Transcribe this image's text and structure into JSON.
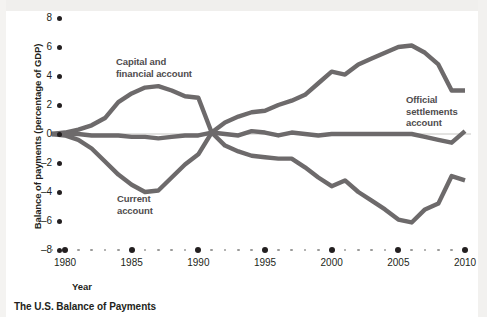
{
  "caption": "The U.S. Balance of Payments",
  "colors": {
    "line": "#6d6a6b",
    "text": "#231f20",
    "annotation": "#4f4c4d",
    "zero_rule": "#b9b7b4",
    "tick_minor": "#9a9a99",
    "background": "#ffffff"
  },
  "axes": {
    "y_title": "Balance of payments (percentage of GDP)",
    "x_title": "Year",
    "y_ticks": [
      "8",
      "6",
      "4",
      "2",
      "0",
      "–2",
      "–4",
      "–6",
      "–8"
    ],
    "x_ticks": [
      "1980",
      "1985",
      "1990",
      "1995",
      "2000",
      "2005",
      "2010"
    ]
  },
  "annotations": {
    "capital": "Capital and\nfinancial account",
    "capital_line1": "Capital and",
    "capital_line2": "financial account",
    "current_line1": "Current",
    "current_line2": "account",
    "official_line1": "Official",
    "official_line2": "settlements",
    "official_line3": "account"
  },
  "chart_data": {
    "type": "line",
    "title": "The U.S. Balance of Payments",
    "xlabel": "Year",
    "ylabel": "Balance of payments (percentage of GDP)",
    "xlim": [
      1979,
      2010.5
    ],
    "ylim": [
      -8,
      8
    ],
    "grid": false,
    "legend": "inline-annotations",
    "x": [
      1979,
      1980,
      1981,
      1982,
      1983,
      1984,
      1985,
      1986,
      1987,
      1988,
      1989,
      1990,
      1991,
      1992,
      1993,
      1994,
      1995,
      1996,
      1997,
      1998,
      1999,
      2000,
      2001,
      2002,
      2003,
      2004,
      2005,
      2006,
      2007,
      2008,
      2009,
      2010
    ],
    "series": [
      {
        "name": "Capital and financial account",
        "label": "Capital and financial account",
        "values": [
          0.0,
          0.1,
          0.3,
          0.6,
          1.1,
          2.2,
          2.8,
          3.2,
          3.3,
          3.0,
          2.6,
          2.5,
          0.1,
          0.8,
          1.2,
          1.5,
          1.6,
          2.0,
          2.3,
          2.7,
          3.5,
          4.3,
          4.1,
          4.8,
          5.2,
          5.6,
          6.0,
          6.1,
          5.6,
          4.8,
          3.0,
          3.0
        ]
      },
      {
        "name": "Current account",
        "label": "Current account",
        "values": [
          0.0,
          -0.1,
          -0.4,
          -1.0,
          -1.9,
          -2.8,
          -3.5,
          -4.0,
          -3.9,
          -3.0,
          -2.1,
          -1.4,
          0.1,
          -0.8,
          -1.2,
          -1.5,
          -1.6,
          -1.7,
          -1.7,
          -2.3,
          -3.0,
          -3.6,
          -3.2,
          -4.0,
          -4.6,
          -5.2,
          -5.9,
          -6.1,
          -5.2,
          -4.8,
          -2.9,
          -3.2
        ]
      },
      {
        "name": "Official settlements account",
        "label": "Official settlements account",
        "values": [
          0.0,
          0.0,
          0.0,
          -0.1,
          -0.1,
          -0.1,
          -0.2,
          -0.2,
          -0.3,
          -0.2,
          -0.1,
          -0.1,
          0.1,
          0.0,
          -0.1,
          0.2,
          0.1,
          -0.1,
          0.1,
          0.0,
          -0.1,
          0.0,
          0.0,
          0.0,
          0.0,
          0.0,
          0.0,
          0.0,
          -0.2,
          -0.4,
          -0.6,
          0.2
        ]
      }
    ]
  }
}
